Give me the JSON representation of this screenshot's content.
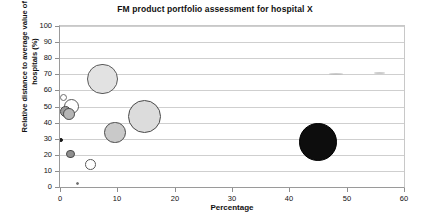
{
  "chart_data": {
    "type": "scatter",
    "title": "FM product portfolio assessment for hospital X",
    "xlabel": "Percentage",
    "ylabel": "Relative distance to average value of all hospitals (%)",
    "xlim": [
      0,
      60
    ],
    "ylim": [
      0,
      100
    ],
    "xticks": [
      0,
      10,
      20,
      30,
      40,
      50,
      60
    ],
    "yticks": [
      0,
      10,
      20,
      30,
      40,
      50,
      60,
      70,
      80,
      90,
      100
    ],
    "grid": "horizontal",
    "legend": "none",
    "points": [
      {
        "label": "bubble-1",
        "x": 0.6,
        "y": 55.5,
        "size": 3.0,
        "fill": "#ffffff",
        "stroke": "#6e6e6e"
      },
      {
        "label": "bubble-2",
        "x": 2.0,
        "y": 50.0,
        "size": 6.5,
        "fill": "#ffffff",
        "stroke": "#5a5a5a"
      },
      {
        "label": "bubble-3",
        "x": 1.0,
        "y": 47.0,
        "size": 4.5,
        "fill": "#9a9a9a",
        "stroke": "#4a4a4a"
      },
      {
        "label": "bubble-4",
        "x": 1.6,
        "y": 45.5,
        "size": 5.0,
        "fill": "#b5b5b5",
        "stroke": "#4a4a4a"
      },
      {
        "label": "bubble-5",
        "x": 0.2,
        "y": 29.0,
        "size": 1.8,
        "fill": "#1a1a1a",
        "stroke": "#1a1a1a"
      },
      {
        "label": "bubble-6",
        "x": 1.8,
        "y": 20.5,
        "size": 3.8,
        "fill": "#8f8f8f",
        "stroke": "#4a4a4a"
      },
      {
        "label": "bubble-7",
        "x": 5.3,
        "y": 14.0,
        "size": 4.6,
        "fill": "#ffffff",
        "stroke": "#5a5a5a"
      },
      {
        "label": "bubble-8",
        "x": 3.1,
        "y": 2.0,
        "size": 1.3,
        "fill": "#6e6e6e",
        "stroke": "#6e6e6e"
      },
      {
        "label": "bubble-9",
        "x": 7.4,
        "y": 67.0,
        "size": 13.0,
        "fill": "#e2e2e2",
        "stroke": "#5a5a5a"
      },
      {
        "label": "bubble-10",
        "x": 9.6,
        "y": 34.0,
        "size": 9.0,
        "fill": "#c9c9c9",
        "stroke": "#4a4a4a"
      },
      {
        "label": "bubble-11",
        "x": 14.8,
        "y": 44.0,
        "size": 14.0,
        "fill": "#dcdcdc",
        "stroke": "#4a4a4a"
      },
      {
        "label": "bubble-12",
        "x": 45.0,
        "y": 28.0,
        "size": 16.0,
        "fill": "#0d0d0d",
        "stroke": "#000000"
      }
    ],
    "artifacts": [
      {
        "label": "artifact-1",
        "x": 48.2,
        "y": 70.0,
        "width": 14
      },
      {
        "label": "artifact-2",
        "x": 55.8,
        "y": 70.5,
        "width": 11
      }
    ]
  }
}
